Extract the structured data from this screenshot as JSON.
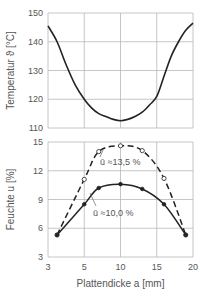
{
  "chart_data": [
    {
      "type": "line",
      "title": "",
      "xlabel": "Plattendicke a [mm]",
      "ylabel": "Temperatur ϑ [°C]",
      "xlim": [
        3,
        20
      ],
      "ylim": [
        110,
        150
      ],
      "x_ticks": [
        3,
        5,
        10,
        15,
        20
      ],
      "y_ticks": [
        110,
        120,
        130,
        140,
        150
      ],
      "grid": true,
      "series": [
        {
          "name": "Temperatur",
          "style": "solid",
          "x": [
            3,
            3.5,
            4,
            4.5,
            5,
            6,
            7,
            8,
            9,
            10,
            11,
            12,
            13,
            14,
            15,
            16,
            17,
            18,
            19,
            20
          ],
          "values": [
            145.5,
            140,
            132,
            125,
            120,
            117,
            115,
            114,
            113,
            112.5,
            113,
            114,
            115.5,
            118,
            121,
            128,
            135,
            140,
            144,
            146.5
          ]
        }
      ]
    },
    {
      "type": "line",
      "title": "",
      "xlabel": "Plattendicke a [mm]",
      "ylabel": "Feuchte u [%]",
      "xlim": [
        3,
        20
      ],
      "ylim": [
        3,
        15
      ],
      "x_ticks": [
        3,
        5,
        10,
        15,
        20
      ],
      "y_ticks": [
        3,
        6,
        9,
        12,
        15
      ],
      "grid": true,
      "series": [
        {
          "name": "ū ≈13,5 %",
          "style": "dashed",
          "marker": "open-circle",
          "x": [
            3.5,
            5,
            7,
            10,
            13,
            16,
            19
          ],
          "values": [
            5.3,
            11.1,
            14.0,
            14.6,
            14.1,
            11.2,
            5.3
          ]
        },
        {
          "name": "ū ≈10,0 %",
          "style": "solid",
          "marker": "filled-circle",
          "x": [
            3.5,
            5,
            7,
            10,
            13,
            16,
            19
          ],
          "values": [
            5.3,
            8.5,
            10.2,
            10.6,
            10.1,
            8.5,
            5.3
          ]
        }
      ],
      "annotations": [
        "ū ≈13,5 %",
        "ū ≈10,0 %"
      ]
    }
  ],
  "labels": {
    "top_ylabel": "Temperatur ϑ [°C]",
    "bottom_ylabel": "Feuchte u [%]",
    "xlabel": "Plattendicke a [mm]",
    "annot_dashed": "ū ≈13,5 %",
    "annot_solid": "ū ≈10,0 %"
  }
}
